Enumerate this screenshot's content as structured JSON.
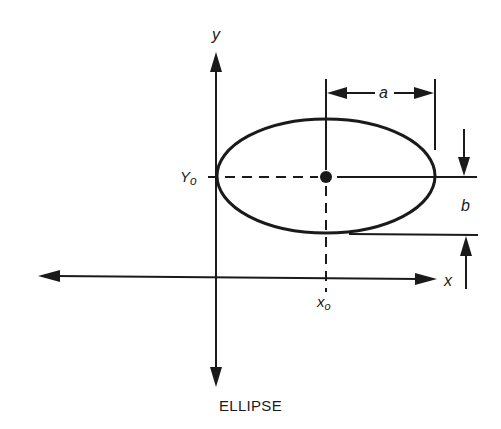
{
  "diagram": {
    "title": "ELLIPSE",
    "labels": {
      "y_axis": "y",
      "x_axis": "x",
      "center_y": "Y",
      "center_y_sub": "o",
      "center_x": "x",
      "center_x_sub": "o",
      "semi_major": "a",
      "semi_minor": "b"
    },
    "colors": {
      "ink": "#1a1a1a",
      "background": "#ffffff"
    },
    "geometry": {
      "center": [
        326,
        177
      ],
      "semi_major_px": 108,
      "semi_minor_px": 57,
      "y_axis_x": 216,
      "x_axis_y": 277
    }
  }
}
